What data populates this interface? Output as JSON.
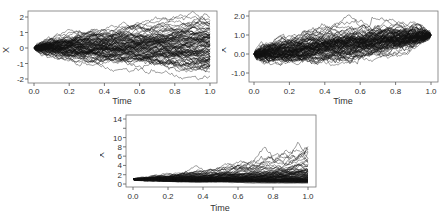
{
  "chart_data": [
    {
      "type": "line",
      "title": "",
      "description": "Many simulated Brownian motion paths starting at 0 (approx. 100 paths)",
      "xlabel": "Time",
      "ylabel": "X",
      "xlim": [
        0.0,
        1.0
      ],
      "ylim": [
        -2.2,
        2.2
      ],
      "xticks": [
        "0.0",
        "0.2",
        "0.4",
        "0.6",
        "0.8",
        "1.0"
      ],
      "yticks": [
        "-2",
        "-1",
        "0",
        "1",
        "2"
      ],
      "grid": false,
      "legend": false,
      "series_summary": {
        "n_paths": 100,
        "start": 0,
        "drift": 0,
        "sigma": 1,
        "end_range": [
          -2.1,
          2.1
        ]
      }
    },
    {
      "type": "line",
      "title": "",
      "description": "Many simulated Brownian bridge-like paths from 0 at t=0 converging to 1 at t=1",
      "xlabel": "Time",
      "ylabel": "X",
      "xlim": [
        0.0,
        1.0
      ],
      "ylim": [
        -1.3,
        2.2
      ],
      "xticks": [
        "0.0",
        "0.2",
        "0.4",
        "0.6",
        "0.8",
        "1.0"
      ],
      "yticks": [
        "-1.0",
        "0.0",
        "1.0",
        "2.0"
      ],
      "grid": false,
      "legend": false,
      "series_summary": {
        "n_paths": 100,
        "start": 0,
        "end": 1,
        "range": [
          -1.3,
          2.0
        ]
      }
    },
    {
      "type": "line",
      "title": "",
      "description": "Many simulated geometric Brownian motion paths starting at 1",
      "xlabel": "Time",
      "ylabel": "X",
      "xlim": [
        0.0,
        1.0
      ],
      "ylim": [
        0,
        14.5
      ],
      "xticks": [
        "0.0",
        "0.2",
        "0.4",
        "0.6",
        "0.8",
        "1.0"
      ],
      "yticks": [
        "0",
        "2",
        "4",
        "6",
        "8",
        "10",
        "12",
        "14"
      ],
      "ytick_labels_shown": [
        "0",
        "2",
        "4",
        "6",
        "8",
        "10",
        "14"
      ],
      "grid": false,
      "legend": false,
      "series_summary": {
        "n_paths": 100,
        "start": 1,
        "max": 13.5,
        "range": [
          0.1,
          13.5
        ]
      }
    }
  ],
  "charts": [
    {
      "xlabel": "Time",
      "ylabel": "X"
    },
    {
      "xlabel": "Time",
      "ylabel": "X"
    },
    {
      "xlabel": "Time",
      "ylabel": "X"
    }
  ],
  "colors": {
    "line": "#111111",
    "axis": "#555555",
    "text": "#333333"
  }
}
